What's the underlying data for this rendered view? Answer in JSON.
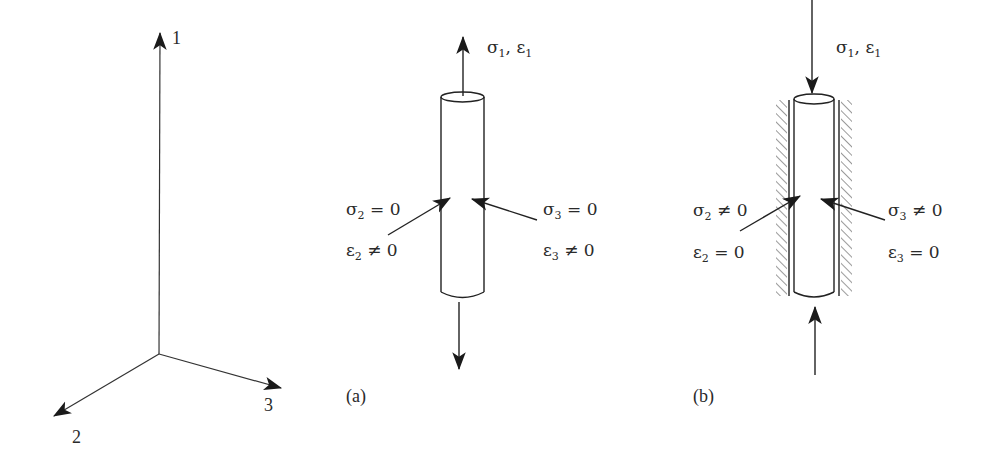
{
  "figure": {
    "axes": {
      "labels": [
        "1",
        "2",
        "3"
      ]
    },
    "panel_a": {
      "caption": "(a)",
      "top_label": {
        "sym1": "σ",
        "sub1": "1",
        "sep": ", ",
        "sym2": "ε",
        "sub2": "1"
      },
      "left_stress": {
        "sym": "σ",
        "sub": "2",
        "rel": " = 0"
      },
      "left_strain": {
        "sym": "ε",
        "sub": "2",
        "rel": " ≠ 0"
      },
      "right_stress": {
        "sym": "σ",
        "sub": "3",
        "rel": " = 0"
      },
      "right_strain": {
        "sym": "ε",
        "sub": "3",
        "rel": " ≠ 0"
      },
      "loading": "tension (unconfined)"
    },
    "panel_b": {
      "caption": "(b)",
      "top_label": {
        "sym1": "σ",
        "sub1": "1",
        "sep": ", ",
        "sym2": "ε",
        "sub2": "1"
      },
      "left_stress": {
        "sym": "σ",
        "sub": "2",
        "rel": " ≠ 0"
      },
      "left_strain": {
        "sym": "ε",
        "sub": "2",
        "rel": " = 0"
      },
      "right_stress": {
        "sym": "σ",
        "sub": "3",
        "rel": " ≠ 0"
      },
      "right_strain": {
        "sym": "ε",
        "sub": "3",
        "rel": " = 0"
      },
      "loading": "compression (laterally confined)"
    },
    "colors": {
      "line": "#222222",
      "hatch": "#9a9a9a",
      "background": "#ffffff"
    }
  }
}
